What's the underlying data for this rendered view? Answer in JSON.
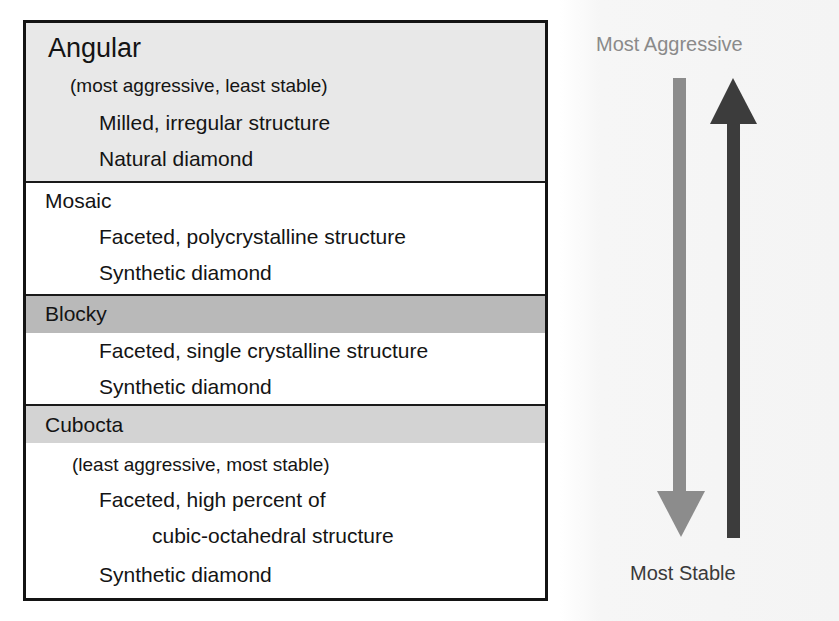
{
  "diagram": {
    "table": {
      "sections": [
        {
          "name": "Angular",
          "note": "(most aggressive, least stable)",
          "details": [
            "Milled, irregular structure",
            "Natural diamond"
          ],
          "header_band_color": "#e8e8e8"
        },
        {
          "name": "Mosaic",
          "details": [
            "Faceted, polycrystalline structure",
            "Synthetic diamond"
          ],
          "header_band_color": "#ffffff"
        },
        {
          "name": "Blocky",
          "details": [
            "Faceted, single crystalline structure",
            "Synthetic diamond"
          ],
          "header_band_color": "#b9b9b9"
        },
        {
          "name": "Cubocta",
          "note": "(least aggressive, most stable)",
          "details": [
            "Faceted, high percent of",
            "cubic-octahedral structure",
            "Synthetic diamond"
          ],
          "header_band_color": "#d3d3d3"
        }
      ]
    },
    "scale": {
      "top_label": "Most Aggressive",
      "bottom_label": "Most Stable",
      "top_label_color": "#8a8a8a",
      "bottom_label_color": "#3a3a3a",
      "down_arrow_color": "#8c8c8c",
      "up_arrow_color": "#3c3c3c"
    }
  }
}
